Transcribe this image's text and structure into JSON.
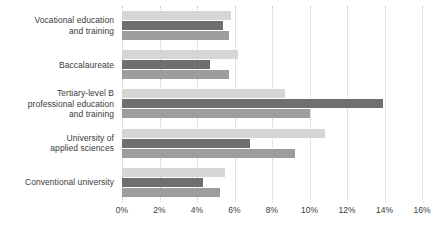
{
  "chart_data": {
    "type": "bar",
    "orientation": "horizontal",
    "title": "",
    "subtitle": "",
    "xlabel": "",
    "ylabel": "",
    "xlim": [
      0,
      16
    ],
    "xunit": "%",
    "grid": true,
    "legend_position": "none",
    "xticks": [
      "0%",
      "2%",
      "4%",
      "6%",
      "8%",
      "10%",
      "12%",
      "14%",
      "16%"
    ],
    "xtick_values": [
      0,
      2,
      4,
      6,
      8,
      10,
      12,
      14,
      16
    ],
    "categories": [
      "Vocational education and training",
      "Baccalaureate",
      "Tertiary-level B professional education and training",
      "University of applied sciences",
      "Conventional university"
    ],
    "category_lines": [
      [
        "Vocational education",
        "and training"
      ],
      [
        "Baccalaureate"
      ],
      [
        "Tertiary-level B",
        "professional education",
        "and training"
      ],
      [
        "University of",
        "applied sciences"
      ],
      [
        "Conventional university"
      ]
    ],
    "series": [
      {
        "name": "Series 1",
        "color": "#d6d6d6",
        "values": [
          5.8,
          6.2,
          8.7,
          10.8,
          5.5
        ]
      },
      {
        "name": "Series 2",
        "color": "#6f6f6f",
        "values": [
          5.4,
          4.7,
          13.9,
          6.8,
          4.3
        ]
      },
      {
        "name": "Series 3",
        "color": "#9d9d9d",
        "values": [
          5.7,
          5.7,
          10.0,
          9.2,
          5.2
        ]
      }
    ],
    "colors": {
      "series1": "#d6d6d6",
      "series2": "#6f6f6f",
      "series3": "#9d9d9d",
      "grid": "#c8c8c8",
      "text": "#3b3b3b",
      "background": "#ffffff"
    }
  }
}
